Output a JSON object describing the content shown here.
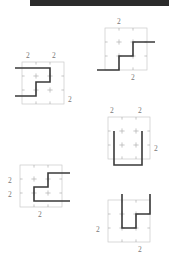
{
  "page": {
    "width": 175,
    "height": 271,
    "background": "#ffffff"
  },
  "banner": {
    "name": "top-black-bar",
    "color": "#2b2b2b",
    "x": 30,
    "y": 0,
    "width": 139,
    "height": 6
  },
  "style": {
    "grid_color": "#c9c9c9",
    "tick_color": "#b0b0b0",
    "path_color": "#3a3a3a",
    "label_color": "#7a7a7a",
    "grid_stroke_width": 0.7,
    "path_stroke_width": 1.6,
    "cell_size": 14,
    "grid_cells": 3
  },
  "figures": [
    {
      "id": "figure-top-right",
      "name": "staircase-up-right",
      "origin": {
        "x": 105,
        "y": 28
      },
      "size": 42,
      "path": "M -8,42 L 14,42 L 14,28 L 28,28 L 28,14 L 50,14",
      "labels": [
        {
          "text": "2",
          "x": 12,
          "y": -10,
          "name": "label-top"
        },
        {
          "text": "2",
          "x": 26,
          "y": 46,
          "name": "label-bottom"
        }
      ]
    },
    {
      "id": "figure-top-left",
      "name": "staircase-left-facing",
      "origin": {
        "x": 22,
        "y": 62
      },
      "size": 42,
      "path": "M -7,6 L 28,6 L 28,20 L 14,20 L 14,34 L -7,34",
      "labels": [
        {
          "text": "2",
          "x": 4,
          "y": -10,
          "name": "label-top-left"
        },
        {
          "text": "2",
          "x": 30,
          "y": -10,
          "name": "label-top-right"
        },
        {
          "text": "2",
          "x": 46,
          "y": 34,
          "name": "label-right"
        }
      ]
    },
    {
      "id": "figure-mid-right",
      "name": "u-shape-open-top",
      "origin": {
        "x": 108,
        "y": 117
      },
      "size": 42,
      "path": "M 6,14 L 6,48 L 34,48 L 34,14",
      "labels": [
        {
          "text": "2",
          "x": 2,
          "y": -10,
          "name": "label-top-left"
        },
        {
          "text": "2",
          "x": 30,
          "y": -10,
          "name": "label-top-right"
        },
        {
          "text": "2",
          "x": 46,
          "y": 28,
          "name": "label-right"
        }
      ]
    },
    {
      "id": "figure-bottom-left",
      "name": "staircase-right-facing",
      "origin": {
        "x": 20,
        "y": 165
      },
      "size": 42,
      "path": "M 50,8 L 28,8 L 28,22 L 14,22 L 14,36 L 50,36",
      "labels": [
        {
          "text": "2",
          "x": -12,
          "y": 12,
          "name": "label-left-upper"
        },
        {
          "text": "2",
          "x": -12,
          "y": 26,
          "name": "label-left-lower"
        },
        {
          "text": "2",
          "x": 18,
          "y": 46,
          "name": "label-bottom"
        }
      ]
    },
    {
      "id": "figure-bottom-right",
      "name": "staircase-notch-down",
      "origin": {
        "x": 108,
        "y": 200
      },
      "size": 42,
      "path": "M 14,-6 L 14,28 L 28,28 L 28,14 L 42,14 L 42,-6",
      "labels": [
        {
          "text": "2",
          "x": -12,
          "y": 26,
          "name": "label-left"
        },
        {
          "text": "2",
          "x": 30,
          "y": 46,
          "name": "label-bottom"
        }
      ]
    }
  ]
}
